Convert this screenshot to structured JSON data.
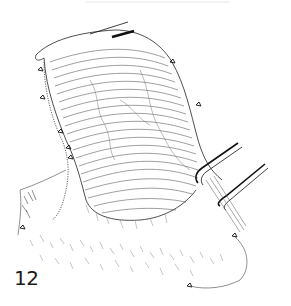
{
  "figure": {
    "number_label": "12",
    "elements": [
      "organ-with-horizontal-hatching",
      "sutures",
      "forceps",
      "tissue-fringe"
    ],
    "ink_color": "#1a1a1a",
    "background_color": "#ffffff"
  }
}
